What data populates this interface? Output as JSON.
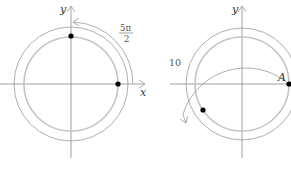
{
  "figure": {
    "left": {
      "x_label": "x",
      "y_label": "y",
      "angle_label_numerator": "5π",
      "angle_label_denominator": "2",
      "description": "Rotation of 5π/2 from positive x-axis ends on positive y-axis"
    },
    "right": {
      "y_label": "y",
      "point_label": "A",
      "angle_label": "10",
      "description": "Rotation of 10 radians from point A ends in third quadrant"
    },
    "colors": {
      "axis": "#888888",
      "circle_inner": "#bbbbbb",
      "circle_outer": "#999999",
      "dot": "#000000"
    }
  }
}
